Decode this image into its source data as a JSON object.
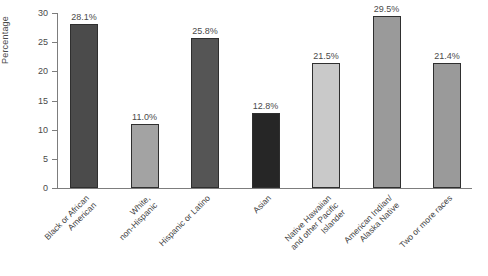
{
  "chart_data": {
    "type": "bar",
    "title": "",
    "subtitle": "",
    "xlabel": "",
    "ylabel": "Percentage",
    "ylim": [
      0,
      30
    ],
    "ytick_step": 5,
    "yticks": [
      "30",
      "25",
      "20",
      "15",
      "10",
      "5",
      "0"
    ],
    "grid": false,
    "legend": "none",
    "categories": [
      "Black or African\nAmerican",
      "White,\nnon-Hispanic",
      "Hispanic or Latino",
      "Asian",
      "Native Hawaiian\nand other Pacific\nIslander",
      "American Indian/\nAlaska Native",
      "Two or more races"
    ],
    "values": [
      28.1,
      11.0,
      25.8,
      12.8,
      21.5,
      29.5,
      21.4
    ],
    "value_labels": [
      "28.1%",
      "11.0%",
      "25.8%",
      "12.8%",
      "21.5%",
      "29.5%",
      "21.4%"
    ],
    "bar_colors": [
      "#4b4b4b",
      "#a3a3a3",
      "#555555",
      "#262626",
      "#c9c9c9",
      "#9a9a9a",
      "#9a9a9a"
    ],
    "bar_border_color": "#2f2f2f"
  },
  "axis": {
    "y_title": "Percentage"
  }
}
